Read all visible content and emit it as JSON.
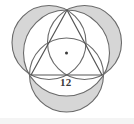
{
  "figure": {
    "shape_type": "geometry-diagram",
    "background_color": "#ffffff",
    "stroke_color": "#5a5a5a",
    "shade_color": "#d6d6d6",
    "center_dot_color": "#3a3a3a",
    "labels": {
      "side_length": "12"
    },
    "triangle": {
      "name": "equilateral-triangle",
      "side_length": 12,
      "vertices": [
        {
          "name": "apex",
          "x": 67,
          "y": 10
        },
        {
          "name": "bottom-right",
          "x": 102,
          "y": 75
        },
        {
          "name": "bottom-left",
          "x": 31,
          "y": 75
        }
      ]
    },
    "circumcircle": {
      "name": "circumcircle",
      "cx": 66.5,
      "cy": 53,
      "r": 43
    },
    "center_point": {
      "name": "circumcenter-dot",
      "cx": 66.5,
      "cy": 53,
      "r": 1.4
    },
    "outer_circles": [
      {
        "name": "circle-on-left-side",
        "cx": 49,
        "cy": 42.5,
        "r": 37
      },
      {
        "name": "circle-on-right-side",
        "cx": 84.5,
        "cy": 42.5,
        "r": 37
      },
      {
        "name": "circle-on-bottom-side",
        "cx": 66.5,
        "cy": 75,
        "r": 37
      }
    ]
  }
}
